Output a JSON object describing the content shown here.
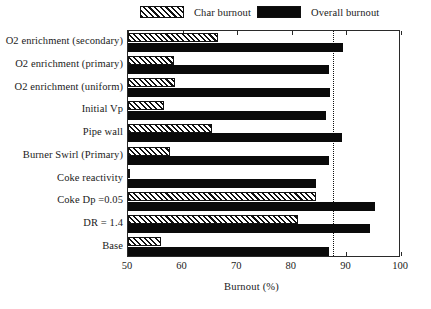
{
  "chart_data": {
    "type": "bar",
    "orientation": "horizontal",
    "title": "",
    "xlabel": "Burnout (%)",
    "ylabel": "",
    "xlim": [
      50,
      100
    ],
    "xticks": [
      50,
      60,
      70,
      80,
      90,
      100
    ],
    "xticklabels": [
      "50",
      "60",
      "70",
      "80",
      "90",
      "100"
    ],
    "grid": false,
    "legend_position": "above-plot",
    "reference_line": {
      "value": 87.5,
      "style": "dotted",
      "color": "#111111"
    },
    "categories": [
      "O2 enrichment (secondary)",
      "O2 enrichment (primary)",
      "O2 enrichment (uniform)",
      "Initial Vp",
      "Pipe wall",
      "Burner Swirl (Primary)",
      "Coke reactivity",
      "Coke  Dp =0.05",
      "DR = 1.4",
      "Base"
    ],
    "series": [
      {
        "name": "Char burnout",
        "color": "#ffffff",
        "pattern": "diagonal-hatch",
        "values": [
          66.4,
          58.5,
          58.6,
          56.6,
          65.4,
          57.7,
          50.3,
          84.5,
          81.2,
          56.1
        ]
      },
      {
        "name": "Overall burnout",
        "color": "#0a0a0a",
        "pattern": "solid",
        "values": [
          89.3,
          86.8,
          87.0,
          86.3,
          89.2,
          86.8,
          84.4,
          95.3,
          94.3,
          86.8
        ]
      }
    ]
  },
  "legend": {
    "entries": [
      {
        "label": "Char burnout",
        "swatch": "hatched-swatch"
      },
      {
        "label": "Overall burnout",
        "swatch": "solid-black-swatch"
      }
    ]
  },
  "axis": {
    "x_title": "Burnout (%)"
  }
}
